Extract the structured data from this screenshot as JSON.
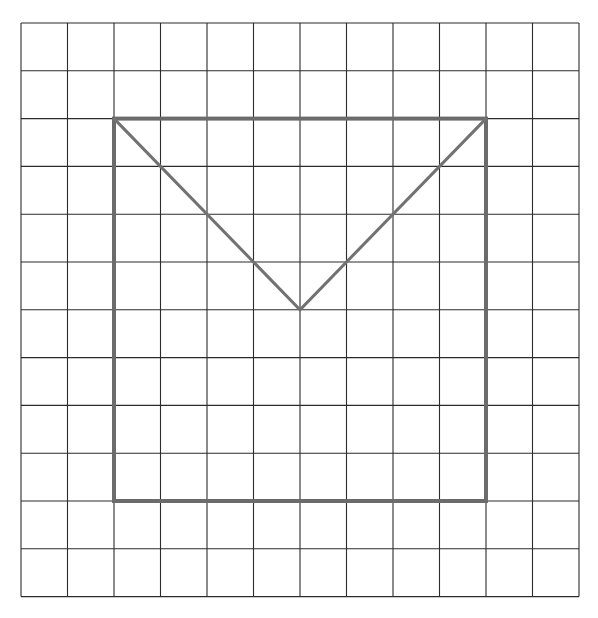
{
  "diagram": {
    "type": "grid-figure",
    "grid": {
      "columns": 12,
      "rows": 12,
      "origin_px": [
        21,
        23
      ],
      "cell_width_px": 46.5,
      "cell_height_px": 47.8,
      "line_color": "#2b2b2b",
      "line_width": 1.1
    },
    "shapes": [
      {
        "name": "square",
        "kind": "rectangle",
        "grid_from": [
          2,
          2
        ],
        "grid_to": [
          10,
          10
        ],
        "stroke": "#6b6b6b",
        "stroke_width": 4
      },
      {
        "name": "v-shape",
        "kind": "polyline",
        "grid_points": [
          [
            2,
            2
          ],
          [
            6,
            6
          ],
          [
            10,
            2
          ]
        ],
        "stroke": "#727272",
        "stroke_width": 3
      }
    ]
  }
}
